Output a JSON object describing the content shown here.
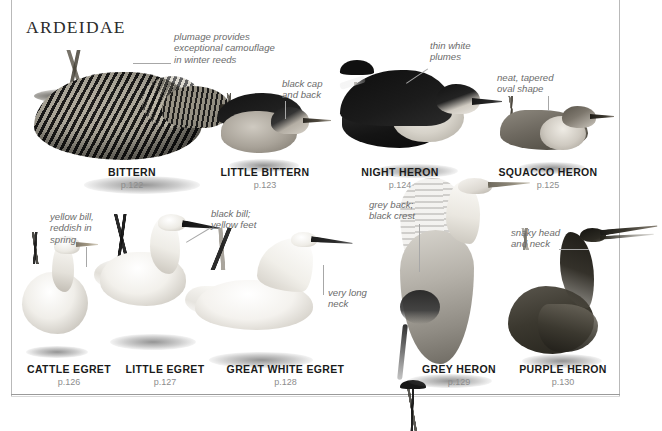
{
  "page": {
    "family_heading": "ARDEIDAE"
  },
  "species": [
    {
      "id": "bittern",
      "name": "BITTERN",
      "page_ref": "p.122"
    },
    {
      "id": "lbittern",
      "name": "LITTLE BITTERN",
      "page_ref": "p.123"
    },
    {
      "id": "nheron",
      "name": "NIGHT HERON",
      "page_ref": "p.124"
    },
    {
      "id": "squacco",
      "name": "SQUACCO HERON",
      "page_ref": "p.125"
    },
    {
      "id": "cegret",
      "name": "CATTLE EGRET",
      "page_ref": "p.126"
    },
    {
      "id": "legret",
      "name": "LITTLE EGRET",
      "page_ref": "p.127"
    },
    {
      "id": "gwegret",
      "name": "GREAT WHITE EGRET",
      "page_ref": "p.128"
    },
    {
      "id": "gheron",
      "name": "GREY HERON",
      "page_ref": "p.129"
    },
    {
      "id": "pheron",
      "name": "PURPLE HERON",
      "page_ref": "p.130"
    }
  ],
  "annotations": [
    {
      "id": "bittern-plumage",
      "text": "plumage provides\nexceptional camouflage\nin winter reeds"
    },
    {
      "id": "lbittern-cap",
      "text": "black cap\nand back"
    },
    {
      "id": "nheron-plumes",
      "text": "thin white\nplumes"
    },
    {
      "id": "squacco-shape",
      "text": "neat, tapered\noval shape"
    },
    {
      "id": "cegret-bill",
      "text": "yellow bill,\nreddish in\nspring"
    },
    {
      "id": "legret-bill",
      "text": "black bill;\nyellow feet"
    },
    {
      "id": "gwegret-neck",
      "text": "very long\nneck"
    },
    {
      "id": "gheron-back",
      "text": "grey back;\nblack crest"
    },
    {
      "id": "pheron-neck",
      "text": "snaky head\nand neck"
    }
  ],
  "colors": {
    "heading": "#2b2b2b",
    "species_name": "#1a1a1a",
    "page_ref": "#8d8d8d",
    "annotation": "#6b6b6b",
    "leader_line": "#a7a7a7",
    "frame_rule": "#b9b9b9",
    "background": "#ffffff"
  }
}
